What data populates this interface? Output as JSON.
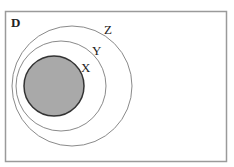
{
  "diagram": {
    "type": "venn-nested",
    "universe_label": "D",
    "sets": [
      {
        "name": "Z",
        "label": "Z",
        "shaded": false
      },
      {
        "name": "Y",
        "label": "Y",
        "shaded": false
      },
      {
        "name": "X",
        "label": "X",
        "shaded": true
      }
    ],
    "relationship": "X ⊂ Y ⊂ Z ⊂ D",
    "colors": {
      "shade": "#a9a9a9",
      "stroke": "#555555",
      "border": "#999999"
    }
  }
}
